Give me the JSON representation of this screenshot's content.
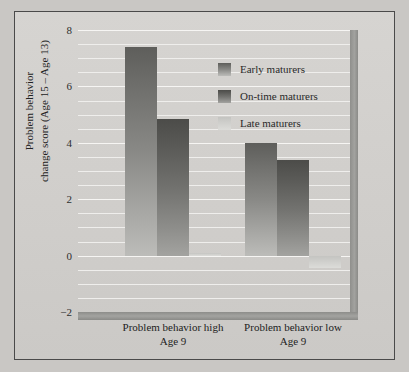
{
  "chart_data": {
    "type": "bar",
    "title": "",
    "xlabel": "",
    "ylabel": "Problem behavior\nchange score (Age 15 – Age 13)",
    "ylabel_line1": "Problem behavior",
    "ylabel_line2": "change score (Age 15 – Age 13)",
    "categories": [
      "Problem behavior high\nAge 9",
      "Problem behavior low\nAge 9"
    ],
    "category_labels": [
      {
        "line1": "Problem behavior high",
        "line2": "Age 9"
      },
      {
        "line1": "Problem behavior low",
        "line2": "Age 9"
      }
    ],
    "ylim": [
      -2,
      8
    ],
    "yticks": [
      8,
      6,
      4,
      2,
      0,
      -2
    ],
    "ytick_labels": [
      "8",
      "6",
      "4",
      "2",
      "0",
      "−2"
    ],
    "gridlines": [
      8,
      7.5,
      7,
      6.5,
      6,
      5.5,
      5,
      4.5,
      4,
      3.5,
      3,
      2.5,
      2,
      1.5,
      1,
      0.5,
      0,
      -0.5,
      -1,
      -1.5
    ],
    "grid": true,
    "legend_position": "upper-right-inside",
    "series": [
      {
        "name": "Early maturers",
        "values": [
          7.4,
          4.0
        ],
        "color": "#8a8a87"
      },
      {
        "name": "On-time maturers",
        "values": [
          4.85,
          3.4
        ],
        "color": "#6e6e6b"
      },
      {
        "name": "Late maturers",
        "values": [
          0.1,
          -0.45
        ],
        "color": "#d2d2cf"
      }
    ]
  },
  "legend": {
    "items": [
      {
        "label": "Early maturers"
      },
      {
        "label": "On-time maturers"
      },
      {
        "label": "Late maturers"
      }
    ]
  },
  "colors": {
    "background": "#c9c7c4",
    "panel": "#d2d0cd",
    "grid": "#f2f1ef",
    "axis_wall": "#9a9a97",
    "text": "#222222"
  }
}
